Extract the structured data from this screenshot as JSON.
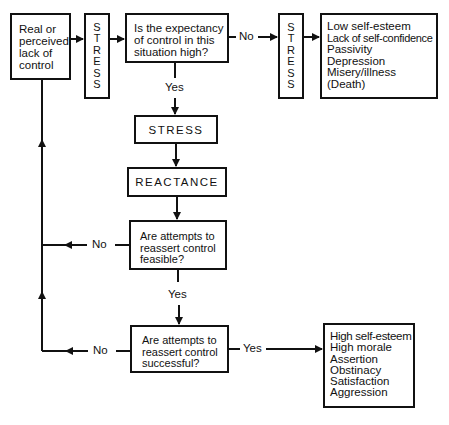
{
  "diagram": {
    "start_box": {
      "lines": [
        "Real or",
        "perceived",
        "lack of",
        "control"
      ]
    },
    "stress_vertical_1": {
      "letters": [
        "S",
        "T",
        "R",
        "E",
        "S",
        "S"
      ]
    },
    "question_expectancy": {
      "lines": [
        "Is the expectancy",
        "of control in this",
        "situation high?"
      ]
    },
    "stress_vertical_2": {
      "letters": [
        "S",
        "T",
        "R",
        "E",
        "S",
        "S"
      ]
    },
    "negative_outcomes": {
      "items": [
        "Low self-esteem",
        "Lack of self-confidence",
        "Passivity",
        "Depression",
        "Misery/illness",
        "(Death)"
      ]
    },
    "stress_box": {
      "label": "STRESS"
    },
    "reactance_box": {
      "label": "REACTANCE"
    },
    "question_feasible": {
      "lines": [
        "Are attempts to",
        "reassert control",
        "feasible?"
      ]
    },
    "question_successful": {
      "lines": [
        "Are attempts to",
        "reassert control",
        "successful?"
      ]
    },
    "positive_outcomes": {
      "items": [
        "High self-esteem",
        "High morale",
        "Assertion",
        "Obstinacy",
        "Satisfaction",
        "Aggression"
      ]
    },
    "edge_labels": {
      "expectancy_no": "No",
      "expectancy_yes": "Yes",
      "feasible_no": "No",
      "feasible_yes": "Yes",
      "successful_no": "No",
      "successful_yes": "Yes"
    },
    "colors": {
      "line": "#111111",
      "background": "#ffffff"
    }
  }
}
